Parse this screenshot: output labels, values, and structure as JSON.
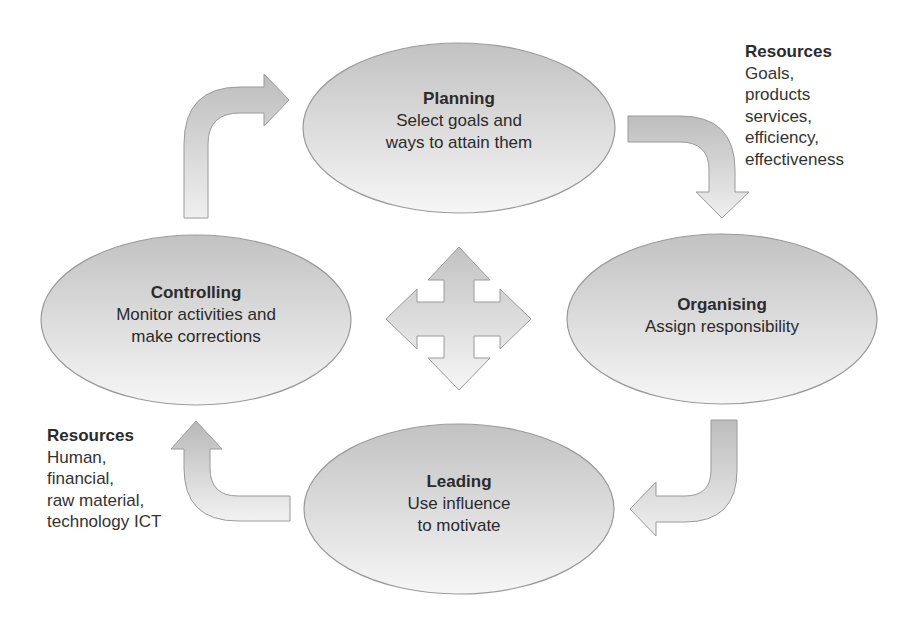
{
  "diagram": {
    "nodes": [
      {
        "id": "planning",
        "title": "Planning",
        "lines": [
          "Select goals and",
          "ways to attain them"
        ]
      },
      {
        "id": "organising",
        "title": "Organising",
        "lines": [
          "Assign responsibility"
        ]
      },
      {
        "id": "leading",
        "title": "Leading",
        "lines": [
          "Use influence",
          "to motivate"
        ]
      },
      {
        "id": "controlling",
        "title": "Controlling",
        "lines": [
          "Monitor activities and",
          "make corrections"
        ]
      }
    ],
    "resources_outputs": {
      "title": "Resources",
      "lines": [
        "Goals,",
        "products",
        "services,",
        "efficiency,",
        "effectiveness"
      ]
    },
    "resources_inputs": {
      "title": "Resources",
      "lines": [
        "Human,",
        "financial,",
        "raw material,",
        "technology ICT"
      ]
    },
    "edges": [
      {
        "from": "controlling",
        "to": "planning",
        "shape": "bent-arrow-up-right"
      },
      {
        "from": "planning",
        "to": "organising",
        "shape": "bent-arrow-right-down"
      },
      {
        "from": "organising",
        "to": "leading",
        "shape": "bent-arrow-down-left"
      },
      {
        "from": "leading",
        "to": "controlling",
        "shape": "bent-arrow-left-up"
      }
    ],
    "center_symbol": "four-way-arrow",
    "colors": {
      "fill_top": "#c2c2c2",
      "fill_bottom": "#f6f6f6",
      "stroke": "#9a9a9a",
      "text": "#2b2b2b"
    }
  }
}
